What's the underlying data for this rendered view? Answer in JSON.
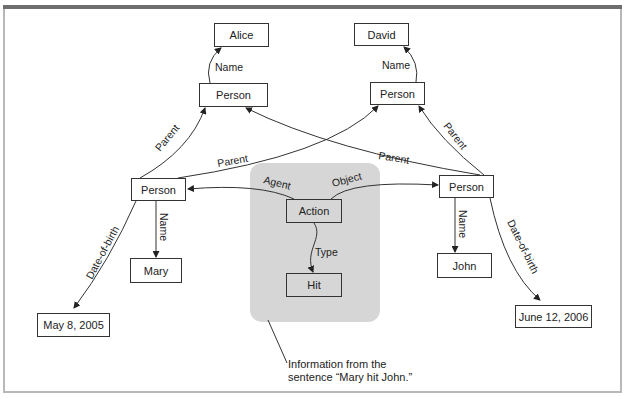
{
  "diagram": {
    "nodes": {
      "alice": {
        "label": "Alice"
      },
      "david": {
        "label": "David"
      },
      "person_parent_left": {
        "label": "Person"
      },
      "person_parent_right": {
        "label": "Person"
      },
      "person_mary": {
        "label": "Person"
      },
      "person_john": {
        "label": "Person"
      },
      "mary": {
        "label": "Mary"
      },
      "john": {
        "label": "John"
      },
      "action": {
        "label": "Action"
      },
      "hit": {
        "label": "Hit"
      },
      "dob_mary": {
        "label": "May 8, 2005"
      },
      "dob_john": {
        "label": "June 12, 2006"
      }
    },
    "edges": {
      "name_alice": "Name",
      "name_david": "Name",
      "name_mary": "Name",
      "name_john": "Name",
      "parent_mary_left": "Parent",
      "parent_mary_right": "Parent",
      "parent_john_left": "Parent",
      "parent_john_right": "Parent",
      "agent": "Agent",
      "object": "Object",
      "type": "Type",
      "dob_mary": "Date-of-birth",
      "dob_john": "Date-of-birth"
    },
    "caption": {
      "line1": "Information from the",
      "line2": "sentence “Mary hit John.”"
    },
    "colors": {
      "panel": "#d6d6d6",
      "stroke": "#333333",
      "top_bar": "#6e6e6e",
      "frame": "#b8b8b8"
    }
  }
}
